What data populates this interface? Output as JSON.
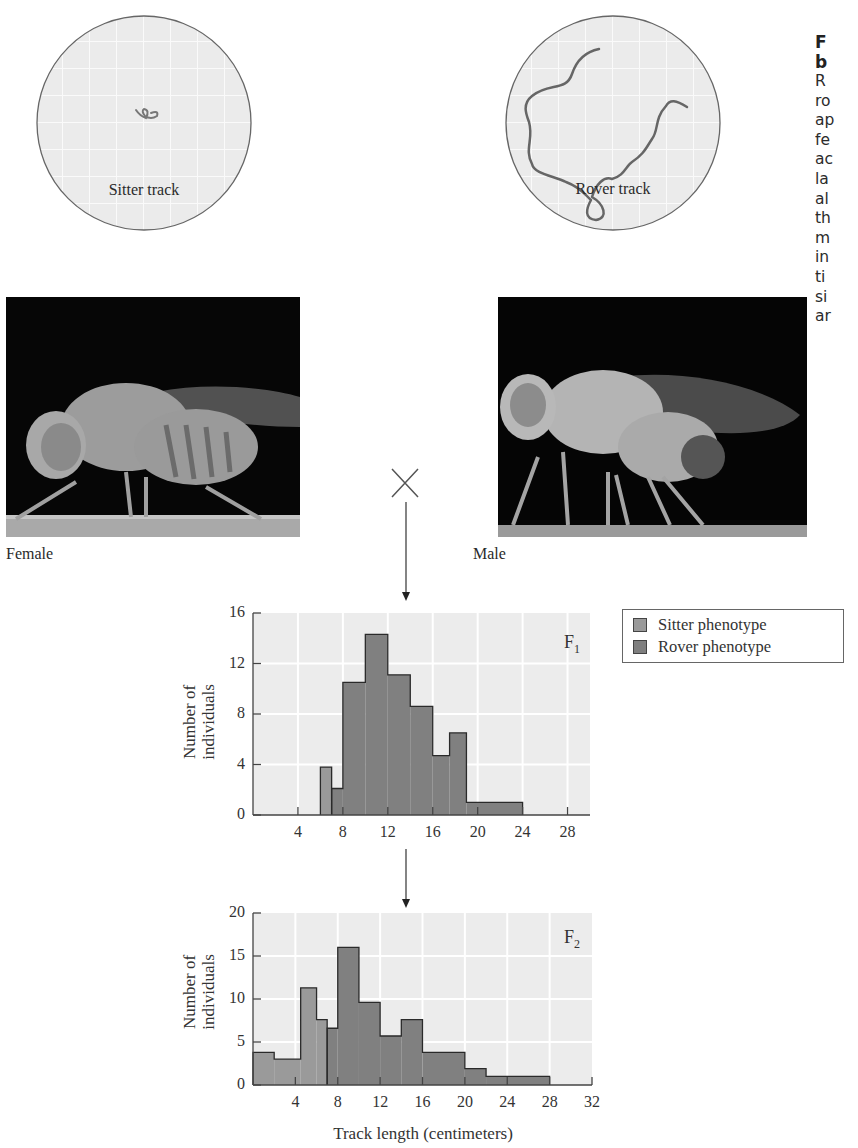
{
  "caption": {
    "title_lines": [
      "F",
      "b"
    ],
    "body_lines": [
      "R",
      "ro",
      "ap",
      "fe",
      "ac",
      "la",
      "al",
      "th",
      "m",
      "in",
      "ti",
      "si",
      "ar"
    ]
  },
  "tracks": {
    "sitter": {
      "label": "Sitter track"
    },
    "rover": {
      "label": "Rover track"
    }
  },
  "photos": {
    "female": {
      "label": "Female"
    },
    "male": {
      "label": "Male"
    }
  },
  "cross_symbol": "×",
  "legend": {
    "items": [
      {
        "label": "Sitter phenotype",
        "color": "#9a9a9a"
      },
      {
        "label": "Rover phenotype",
        "color": "#7f7f7f"
      }
    ]
  },
  "colors": {
    "sitter": "#9a9a9a",
    "rover": "#808080",
    "plot_bg": "#ececec",
    "grid": "#ffffff",
    "outline": "#2a2a2a"
  },
  "chart_data": [
    {
      "type": "bar",
      "title": "F1",
      "generation_label": "F",
      "generation_sub": "1",
      "xlabel": "",
      "ylabel": "Number of individuals",
      "ylabel_lines": [
        "Number of",
        "individuals"
      ],
      "xlim": [
        0,
        30
      ],
      "ylim": [
        0,
        16
      ],
      "xticks": [
        4,
        8,
        12,
        16,
        20,
        24,
        28
      ],
      "yticks": [
        0,
        4,
        8,
        12,
        16
      ],
      "grid": true,
      "bins": [
        {
          "x0": 6,
          "x1": 7,
          "value": 3.8,
          "phenotype": "Sitter"
        },
        {
          "x0": 7,
          "x1": 8,
          "value": 2.1,
          "phenotype": "Rover"
        },
        {
          "x0": 8,
          "x1": 10,
          "value": 10.5,
          "phenotype": "Rover"
        },
        {
          "x0": 10,
          "x1": 12,
          "value": 14.3,
          "phenotype": "Rover"
        },
        {
          "x0": 12,
          "x1": 14,
          "value": 11.1,
          "phenotype": "Rover"
        },
        {
          "x0": 14,
          "x1": 16,
          "value": 8.6,
          "phenotype": "Rover"
        },
        {
          "x0": 16,
          "x1": 17.5,
          "value": 4.7,
          "phenotype": "Rover"
        },
        {
          "x0": 17.5,
          "x1": 19,
          "value": 6.5,
          "phenotype": "Rover"
        },
        {
          "x0": 19,
          "x1": 24,
          "value": 1.0,
          "phenotype": "Rover"
        }
      ],
      "series": [
        {
          "name": "Sitter phenotype",
          "values": [
            3.8
          ]
        },
        {
          "name": "Rover phenotype",
          "values": [
            2.1,
            10.5,
            14.3,
            11.1,
            8.6,
            4.7,
            6.5,
            1.0
          ]
        }
      ]
    },
    {
      "type": "bar",
      "title": "F2",
      "generation_label": "F",
      "generation_sub": "2",
      "xlabel": "Track length (centimeters)",
      "ylabel": "Number of individuals",
      "ylabel_lines": [
        "Number of",
        "individuals"
      ],
      "xlim": [
        0,
        32
      ],
      "ylim": [
        0,
        20
      ],
      "xticks": [
        4,
        8,
        12,
        16,
        20,
        24,
        28,
        32
      ],
      "yticks": [
        0,
        5,
        10,
        15,
        20
      ],
      "grid": true,
      "bins": [
        {
          "x0": 0,
          "x1": 2,
          "value": 3.8,
          "phenotype": "Sitter"
        },
        {
          "x0": 2,
          "x1": 4.5,
          "value": 3.0,
          "phenotype": "Sitter"
        },
        {
          "x0": 4.5,
          "x1": 6,
          "value": 11.3,
          "phenotype": "Sitter"
        },
        {
          "x0": 6,
          "x1": 7,
          "value": 7.6,
          "phenotype": "Sitter"
        },
        {
          "x0": 7,
          "x1": 8,
          "value": 6.6,
          "phenotype": "Rover"
        },
        {
          "x0": 8,
          "x1": 10,
          "value": 16.0,
          "phenotype": "Rover"
        },
        {
          "x0": 10,
          "x1": 12,
          "value": 9.6,
          "phenotype": "Rover"
        },
        {
          "x0": 12,
          "x1": 14,
          "value": 5.7,
          "phenotype": "Rover"
        },
        {
          "x0": 14,
          "x1": 16,
          "value": 7.6,
          "phenotype": "Rover"
        },
        {
          "x0": 16,
          "x1": 20,
          "value": 3.8,
          "phenotype": "Rover"
        },
        {
          "x0": 20,
          "x1": 22,
          "value": 1.9,
          "phenotype": "Rover"
        },
        {
          "x0": 22,
          "x1": 28,
          "value": 1.0,
          "phenotype": "Rover"
        }
      ],
      "series": [
        {
          "name": "Sitter phenotype",
          "values": [
            3.8,
            3.0,
            11.3,
            7.6
          ]
        },
        {
          "name": "Rover phenotype",
          "values": [
            6.6,
            16.0,
            9.6,
            5.7,
            7.6,
            3.8,
            1.9,
            1.0
          ]
        }
      ]
    }
  ]
}
